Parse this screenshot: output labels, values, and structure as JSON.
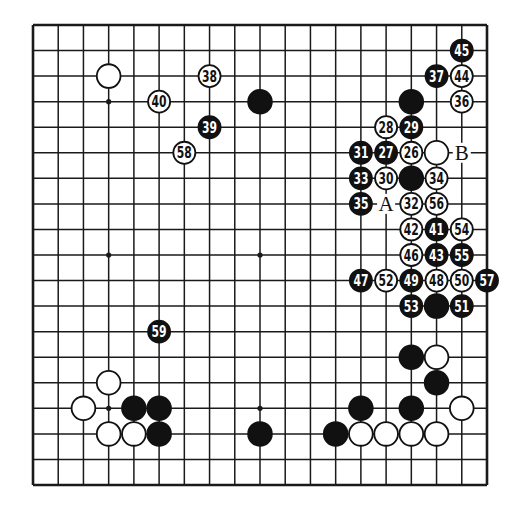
{
  "diagram": {
    "type": "go-board",
    "size": 19,
    "colors": {
      "line": "#1a1a1a",
      "black": "#111111",
      "white": "#ffffff",
      "background": "#ffffff"
    },
    "grid": {
      "left": 33,
      "top": 25,
      "right": 487,
      "bottom": 485
    },
    "hoshi": [
      [
        3,
        3
      ],
      [
        9,
        3
      ],
      [
        15,
        3
      ],
      [
        3,
        9
      ],
      [
        9,
        9
      ],
      [
        15,
        9
      ],
      [
        3,
        15
      ],
      [
        9,
        15
      ],
      [
        15,
        15
      ]
    ],
    "stones": [
      {
        "col": 3,
        "row": 2,
        "color": "white"
      },
      {
        "col": 9,
        "row": 3,
        "color": "black"
      },
      {
        "col": 15,
        "row": 3,
        "color": "black"
      },
      {
        "col": 16,
        "row": 5,
        "color": "white"
      },
      {
        "col": 15,
        "row": 6,
        "color": "black"
      },
      {
        "col": 16,
        "row": 11,
        "color": "black"
      },
      {
        "col": 15,
        "row": 13,
        "color": "black"
      },
      {
        "col": 16,
        "row": 13,
        "color": "white"
      },
      {
        "col": 16,
        "row": 14,
        "color": "black"
      },
      {
        "col": 3,
        "row": 14,
        "color": "white"
      },
      {
        "col": 2,
        "row": 15,
        "color": "white"
      },
      {
        "col": 4,
        "row": 15,
        "color": "black"
      },
      {
        "col": 5,
        "row": 15,
        "color": "black"
      },
      {
        "col": 13,
        "row": 15,
        "color": "black"
      },
      {
        "col": 15,
        "row": 15,
        "color": "black"
      },
      {
        "col": 17,
        "row": 15,
        "color": "white"
      },
      {
        "col": 3,
        "row": 16,
        "color": "white"
      },
      {
        "col": 4,
        "row": 16,
        "color": "white"
      },
      {
        "col": 5,
        "row": 16,
        "color": "black"
      },
      {
        "col": 9,
        "row": 16,
        "color": "black"
      },
      {
        "col": 12,
        "row": 16,
        "color": "black"
      },
      {
        "col": 13,
        "row": 16,
        "color": "white"
      },
      {
        "col": 14,
        "row": 16,
        "color": "white"
      },
      {
        "col": 15,
        "row": 16,
        "color": "white"
      },
      {
        "col": 16,
        "row": 16,
        "color": "white"
      }
    ],
    "numbered_moves": [
      {
        "n": "26",
        "col": 15,
        "row": 5,
        "color": "white"
      },
      {
        "n": "27",
        "col": 14,
        "row": 5,
        "color": "black"
      },
      {
        "n": "28",
        "col": 14,
        "row": 4,
        "color": "white"
      },
      {
        "n": "29",
        "col": 15,
        "row": 4,
        "color": "black"
      },
      {
        "n": "30",
        "col": 14,
        "row": 6,
        "color": "white"
      },
      {
        "n": "31",
        "col": 13,
        "row": 5,
        "color": "black"
      },
      {
        "n": "32",
        "col": 15,
        "row": 7,
        "color": "white"
      },
      {
        "n": "33",
        "col": 13,
        "row": 6,
        "color": "black"
      },
      {
        "n": "34",
        "col": 16,
        "row": 6,
        "color": "white"
      },
      {
        "n": "35",
        "col": 13,
        "row": 7,
        "color": "black"
      },
      {
        "n": "36",
        "col": 17,
        "row": 3,
        "color": "white"
      },
      {
        "n": "37",
        "col": 16,
        "row": 2,
        "color": "black"
      },
      {
        "n": "38",
        "col": 7,
        "row": 2,
        "color": "white"
      },
      {
        "n": "39",
        "col": 7,
        "row": 4,
        "color": "black"
      },
      {
        "n": "40",
        "col": 5,
        "row": 3,
        "color": "white"
      },
      {
        "n": "41",
        "col": 16,
        "row": 8,
        "color": "black"
      },
      {
        "n": "42",
        "col": 15,
        "row": 8,
        "color": "white"
      },
      {
        "n": "43",
        "col": 16,
        "row": 9,
        "color": "black"
      },
      {
        "n": "44",
        "col": 17,
        "row": 2,
        "color": "white"
      },
      {
        "n": "45",
        "col": 17,
        "row": 1,
        "color": "black"
      },
      {
        "n": "46",
        "col": 15,
        "row": 9,
        "color": "white"
      },
      {
        "n": "47",
        "col": 13,
        "row": 10,
        "color": "black"
      },
      {
        "n": "48",
        "col": 16,
        "row": 10,
        "color": "white"
      },
      {
        "n": "49",
        "col": 15,
        "row": 10,
        "color": "black"
      },
      {
        "n": "50",
        "col": 17,
        "row": 10,
        "color": "white"
      },
      {
        "n": "51",
        "col": 17,
        "row": 11,
        "color": "black"
      },
      {
        "n": "52",
        "col": 14,
        "row": 10,
        "color": "white"
      },
      {
        "n": "53",
        "col": 15,
        "row": 11,
        "color": "black"
      },
      {
        "n": "54",
        "col": 17,
        "row": 8,
        "color": "white"
      },
      {
        "n": "55",
        "col": 17,
        "row": 9,
        "color": "black"
      },
      {
        "n": "56",
        "col": 16,
        "row": 7,
        "color": "white"
      },
      {
        "n": "57",
        "col": 18,
        "row": 10,
        "color": "black"
      },
      {
        "n": "58",
        "col": 6,
        "row": 5,
        "color": "white"
      },
      {
        "n": "59",
        "col": 5,
        "row": 12,
        "color": "black"
      }
    ],
    "letter_labels": [
      {
        "text": "A",
        "col": 14,
        "row": 7
      },
      {
        "text": "B",
        "col": 17,
        "row": 5
      }
    ]
  }
}
